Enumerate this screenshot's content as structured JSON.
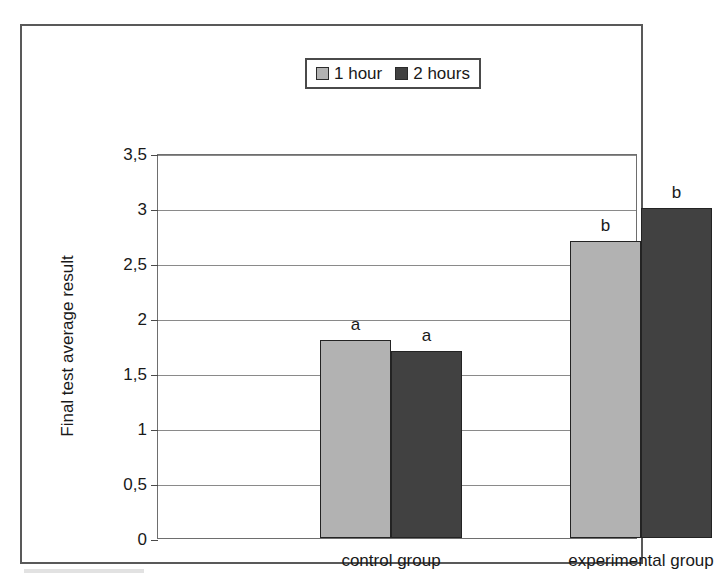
{
  "chart_data": {
    "type": "bar",
    "title": "",
    "xlabel": "",
    "ylabel": "Final test average result",
    "ylim": [
      0,
      3.5
    ],
    "ytick_step": 0.5,
    "decimal_separator": ",",
    "grid": true,
    "legend_position": "top-center",
    "categories": [
      "control group",
      "experimental group"
    ],
    "series": [
      {
        "name": "1 hour",
        "color": "#b2b2b2",
        "values": [
          1.8,
          2.7
        ],
        "annotations": [
          "a",
          "b"
        ]
      },
      {
        "name": "2 hours",
        "color": "#414141",
        "values": [
          1.7,
          3.0
        ],
        "annotations": [
          "a",
          "b"
        ]
      }
    ],
    "ytick_labels": [
      "0",
      "0,5",
      "1",
      "1,5",
      "2",
      "2,5",
      "3",
      "3,5"
    ],
    "ytick_values": [
      0,
      0.5,
      1,
      1.5,
      2,
      2.5,
      3,
      3.5
    ]
  },
  "legend": {
    "entries": [
      {
        "label": "1 hour"
      },
      {
        "label": "2 hours"
      }
    ]
  },
  "axes": {
    "y_title": "Final test average result"
  }
}
